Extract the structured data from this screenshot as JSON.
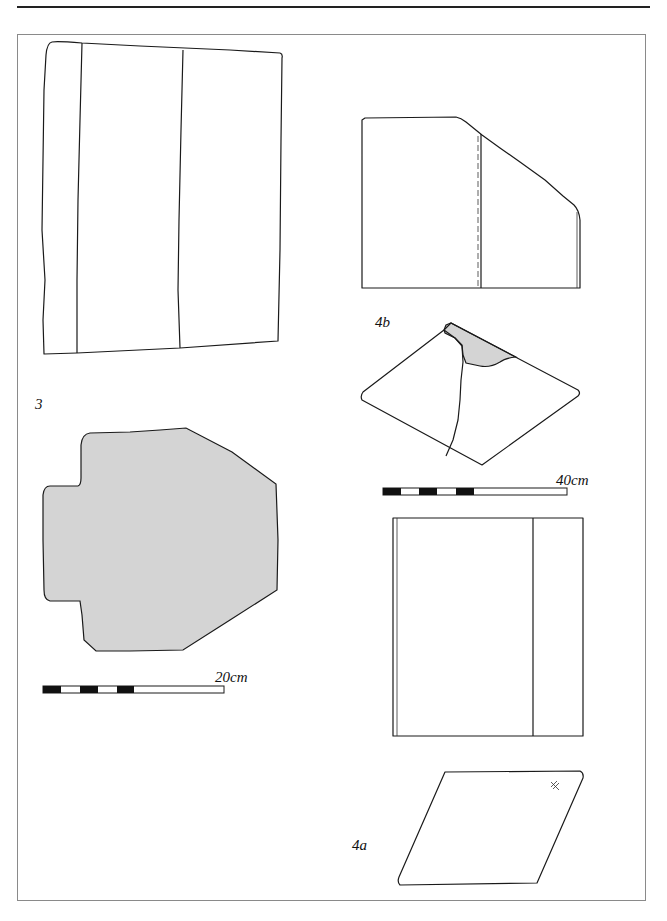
{
  "figure": {
    "objects": [
      {
        "id": "3",
        "label": "3",
        "description": "Slab drawn in elevation (outline with two vertical divisions) and in plan (shaded stepped outline)"
      },
      {
        "id": "4b",
        "label": "4b",
        "description": "Block with chamfered corner in elevation, and isometric view with shaded damaged corner"
      },
      {
        "id": "4a",
        "label": "4a",
        "description": "Rectangular block in elevation and parallelogram isometric view with cross mark"
      }
    ],
    "scale_bars": [
      {
        "id": "scale-20",
        "label": "20cm",
        "segments": [
          "black",
          "white",
          "black",
          "white",
          "black",
          "white-long"
        ]
      },
      {
        "id": "scale-40",
        "label": "40cm",
        "segments": [
          "black",
          "white",
          "black",
          "white",
          "black",
          "white-long"
        ]
      }
    ]
  },
  "colors": {
    "line": "#1a1a1a",
    "shade": "#d4d4d4",
    "frame": "#8a8a8a"
  }
}
